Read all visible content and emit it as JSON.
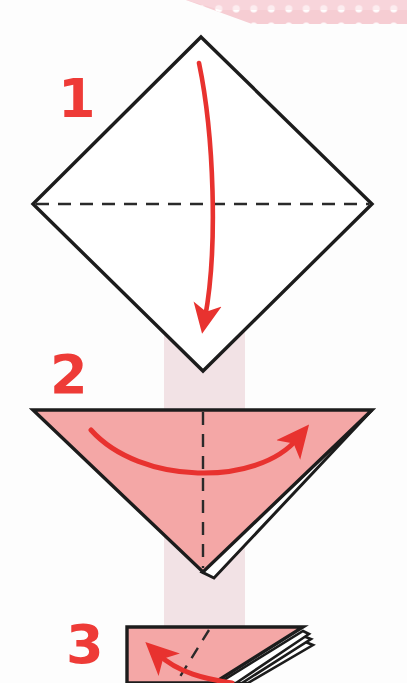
{
  "page": {
    "width": 407,
    "height": 683,
    "background": "#fdfdfd"
  },
  "palette": {
    "paper_pink": "#f4a7a6",
    "paper_pink_shadow": "#eb9a99",
    "arrow_red": "#e8322f",
    "number_red": "#ee3b37",
    "outline_black": "#1c1c1c",
    "band_pale_pink": "#f2e2e5",
    "ribbon_pink": "#f6cdd3",
    "ribbon_dot_white": "#ffffff",
    "white": "#ffffff"
  },
  "decoration": {
    "ribbon": {
      "name": "polka-dot-ribbon",
      "description": "pale pink diagonal ribbon with white polka dots across top-right corner",
      "dot_count": 13
    },
    "vertical_band": {
      "name": "pale-pink-vertical-band",
      "x": 164,
      "width": 81,
      "color": "#f2e2e5"
    }
  },
  "steps": [
    {
      "id": "step-1",
      "number": "1",
      "number_x": 58,
      "number_y": 72,
      "shape": "diamond",
      "shape_label": "square rotated 45 degrees, white side up",
      "fill": "#ffffff",
      "vertices": {
        "top": [
          201,
          37
        ],
        "right": [
          372,
          204
        ],
        "bottom": [
          203,
          371
        ],
        "left": [
          33,
          204
        ]
      },
      "fold_line": {
        "type": "dashed",
        "orientation": "horizontal",
        "from": [
          36,
          204
        ],
        "to": [
          369,
          204
        ]
      },
      "arrow": {
        "name": "fold-down-arrow",
        "direction": "down",
        "curve": "slight-right-bow",
        "from": [
          199,
          63
        ],
        "to": [
          205,
          330
        ],
        "color": "#e8322f"
      }
    },
    {
      "id": "step-2",
      "number": "2",
      "number_x": 50,
      "number_y": 348,
      "shape": "downward-triangle",
      "shape_label": "pink triangle pointing down, two layers",
      "fill": "#f4a7a6",
      "vertices": {
        "top_left": [
          33,
          410
        ],
        "top_right": [
          372,
          410
        ],
        "bottom": [
          203,
          572
        ]
      },
      "fold_line": {
        "type": "dashed",
        "orientation": "vertical",
        "from": [
          203,
          412
        ],
        "to": [
          203,
          568
        ]
      },
      "layer_edge": {
        "name": "paper-layer-edge",
        "layers": 2,
        "side": "bottom-right"
      },
      "arrow": {
        "name": "fold-right-arrow",
        "direction": "right",
        "curve": "downward-bow",
        "from": [
          91,
          430
        ],
        "to": [
          306,
          434
        ],
        "color": "#e8322f"
      }
    },
    {
      "id": "step-3",
      "number": "3",
      "number_x": 66,
      "number_y": 618,
      "shape": "partial-triangle",
      "shape_label": "pink folded shape, multiple layers, cropped at page bottom",
      "fill": "#f4a7a6",
      "vertices": {
        "top_left": [
          127,
          627
        ],
        "top_right": [
          303,
          627
        ],
        "bottom_left": [
          127,
          683
        ]
      },
      "fold_line": {
        "type": "dashed",
        "orientation": "diagonal",
        "from": [
          208,
          630
        ],
        "to": [
          178,
          683
        ]
      },
      "layer_edge": {
        "name": "paper-layer-edge",
        "layers": 4,
        "side": "right"
      },
      "arrow": {
        "name": "fold-up-left-arrow",
        "direction": "up-left",
        "curve": "rising-bow",
        "from": [
          228,
          683
        ],
        "to": [
          150,
          648
        ],
        "color": "#e8322f"
      }
    }
  ]
}
